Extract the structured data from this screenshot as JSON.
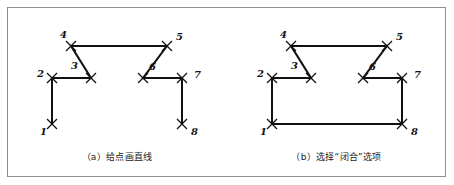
{
  "figure": {
    "background_color": "#ffffff",
    "border_color": "#8d8d8d",
    "line_color": "#111111",
    "marker_color": "#111111",
    "label_color": "#121212",
    "width": 454,
    "height": 185
  },
  "panels": [
    {
      "id": "a",
      "caption": "（a）给点画直线",
      "closed": false,
      "points": [
        {
          "label": "1",
          "x": 45,
          "y": 117,
          "label_x": 33,
          "label_y": 128
        },
        {
          "label": "2",
          "x": 45,
          "y": 71,
          "label_x": 30,
          "label_y": 70
        },
        {
          "label": "3",
          "x": 84,
          "y": 71,
          "label_x": 64,
          "label_y": 62
        },
        {
          "label": "4",
          "x": 64,
          "y": 39,
          "label_x": 53,
          "label_y": 31
        },
        {
          "label": "5",
          "x": 160,
          "y": 39,
          "label_x": 169,
          "label_y": 33
        },
        {
          "label": "6",
          "x": 136,
          "y": 71,
          "label_x": 142,
          "label_y": 63
        },
        {
          "label": "7",
          "x": 175,
          "y": 71,
          "label_x": 187,
          "label_y": 71
        },
        {
          "label": "8",
          "x": 175,
          "y": 117,
          "label_x": 184,
          "label_y": 128
        }
      ],
      "segments": [
        [
          1,
          2
        ],
        [
          2,
          3
        ],
        [
          3,
          4
        ],
        [
          4,
          5
        ],
        [
          5,
          6
        ],
        [
          6,
          7
        ],
        [
          7,
          8
        ]
      ]
    },
    {
      "id": "b",
      "caption": "（b）选择“闭合”选项",
      "closed": true,
      "points": [
        {
          "label": "1",
          "x": 45,
          "y": 117,
          "label_x": 33,
          "label_y": 128
        },
        {
          "label": "2",
          "x": 45,
          "y": 71,
          "label_x": 30,
          "label_y": 70
        },
        {
          "label": "3",
          "x": 84,
          "y": 71,
          "label_x": 64,
          "label_y": 62
        },
        {
          "label": "4",
          "x": 64,
          "y": 39,
          "label_x": 53,
          "label_y": 31
        },
        {
          "label": "5",
          "x": 160,
          "y": 39,
          "label_x": 169,
          "label_y": 33
        },
        {
          "label": "6",
          "x": 136,
          "y": 71,
          "label_x": 142,
          "label_y": 63
        },
        {
          "label": "7",
          "x": 175,
          "y": 71,
          "label_x": 187,
          "label_y": 71
        },
        {
          "label": "8",
          "x": 175,
          "y": 117,
          "label_x": 184,
          "label_y": 128
        }
      ],
      "segments": [
        [
          1,
          2
        ],
        [
          2,
          3
        ],
        [
          3,
          4
        ],
        [
          4,
          5
        ],
        [
          5,
          6
        ],
        [
          6,
          7
        ],
        [
          7,
          8
        ],
        [
          8,
          1
        ]
      ]
    }
  ]
}
